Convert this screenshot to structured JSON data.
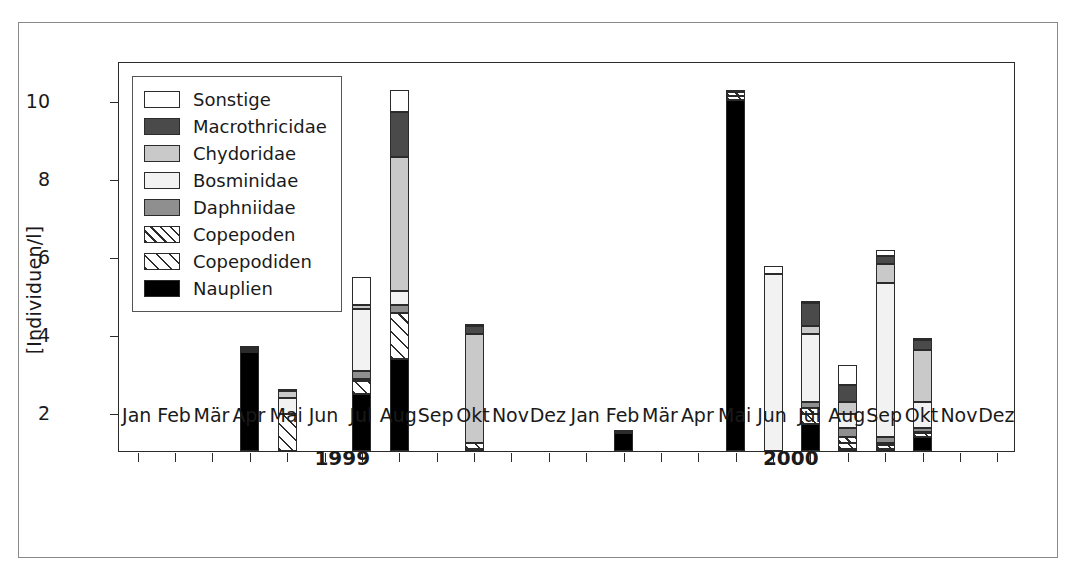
{
  "chart_data": {
    "type": "bar",
    "stacked": true,
    "title": "",
    "xlabel": "",
    "ylabel": "[Individuen/l]",
    "ylim": [
      1,
      11
    ],
    "yticks": [
      2,
      4,
      6,
      8,
      10
    ],
    "grid": false,
    "legend_position": "top-left",
    "period_labels": [
      "1999",
      "2000"
    ],
    "categories": [
      "Jan",
      "Feb",
      "Mär",
      "Apr",
      "Mai",
      "Jun",
      "Jul",
      "Aug",
      "Sep",
      "Okt",
      "Nov",
      "Dez",
      "Jan",
      "Feb",
      "Mär",
      "Apr",
      "Mai",
      "Jun",
      "Jul",
      "Aug",
      "Sep",
      "Okt",
      "Nov",
      "Dez"
    ],
    "series": [
      {
        "name": "Nauplien",
        "key": "nauplien",
        "color": "#000000",
        "pattern": "solid",
        "values": [
          0,
          0,
          0,
          3.55,
          0,
          0,
          2.45,
          3.35,
          0,
          1.05,
          0,
          0,
          0,
          1.45,
          0,
          0,
          10.0,
          0,
          1.7,
          1.05,
          1.05,
          1.35,
          0,
          0
        ]
      },
      {
        "name": "Copepodiden",
        "key": "copepodiden",
        "color": "#ffffff",
        "pattern": "hatch-wide",
        "values": [
          0,
          0,
          0,
          0.05,
          1.95,
          0,
          0.35,
          1.2,
          0,
          0.15,
          0,
          0,
          0,
          0.05,
          0,
          0,
          0.1,
          0,
          0.25,
          0.15,
          0.1,
          0.1,
          0,
          0
        ]
      },
      {
        "name": "Copepoden",
        "key": "copepoden",
        "color": "#ffffff",
        "pattern": "hatch-tight",
        "values": [
          0,
          0,
          0,
          0,
          0,
          0,
          0.05,
          0,
          0,
          0,
          0,
          0,
          0,
          0,
          0,
          0,
          0.1,
          0,
          0.15,
          0.15,
          0.05,
          0.05,
          0,
          0
        ]
      },
      {
        "name": "Daphniidae",
        "key": "daphniidae",
        "color": "#8f8f8f",
        "pattern": "solid",
        "values": [
          0,
          0,
          0,
          0,
          0,
          0,
          0.2,
          0.2,
          0,
          0,
          0,
          0,
          0,
          0,
          0,
          0,
          0,
          0,
          0.15,
          0.25,
          0.15,
          0.1,
          0,
          0
        ]
      },
      {
        "name": "Bosminidae",
        "key": "bosminidae",
        "color": "#f2f2f2",
        "pattern": "solid",
        "values": [
          0,
          0,
          0,
          0.05,
          0.4,
          0,
          1.6,
          0.35,
          0,
          0,
          0,
          0,
          0,
          0,
          0,
          0,
          0,
          5.55,
          1.75,
          0.35,
          3.95,
          0.65,
          0,
          0
        ]
      },
      {
        "name": "Chydoridae",
        "key": "chydoridae",
        "color": "#c9c9c9",
        "pattern": "solid",
        "values": [
          0,
          0,
          0,
          0,
          0.2,
          0,
          0.1,
          3.45,
          0,
          2.8,
          0,
          0,
          0,
          0,
          0,
          0,
          0,
          0,
          0.2,
          0.3,
          0.5,
          1.35,
          0,
          0
        ]
      },
      {
        "name": "Macrothricidae",
        "key": "macrothricidae",
        "color": "#4a4a4a",
        "pattern": "solid",
        "values": [
          0,
          0,
          0,
          0,
          0,
          0,
          0,
          1.15,
          0,
          0.2,
          0,
          0,
          0,
          0,
          0,
          0,
          0,
          0,
          0.6,
          0.45,
          0.2,
          0.25,
          0,
          0
        ]
      },
      {
        "name": "Sonstige",
        "key": "sonstige",
        "color": "#ffffff",
        "pattern": "solid",
        "values": [
          0,
          0,
          0,
          0.05,
          0.05,
          0,
          0.7,
          0.55,
          0,
          0.05,
          0,
          0,
          0,
          0.05,
          0,
          0,
          0.05,
          0.2,
          0.05,
          0.5,
          0.15,
          0.05,
          0,
          0
        ]
      }
    ]
  },
  "legend": {
    "items": [
      {
        "label": "Sonstige",
        "swatch": "sw-sonstige"
      },
      {
        "label": "Macrothricidae",
        "swatch": "sw-macrothricidae"
      },
      {
        "label": "Chydoridae",
        "swatch": "sw-chydoridae"
      },
      {
        "label": "Bosminidae",
        "swatch": "sw-bosminidae"
      },
      {
        "label": "Daphniidae",
        "swatch": "sw-daphniidae"
      },
      {
        "label": "Copepoden",
        "swatch": "sw-copepoden"
      },
      {
        "label": "Copepodiden",
        "swatch": "sw-copepodiden"
      },
      {
        "label": "Nauplien",
        "swatch": "sw-nauplien"
      }
    ]
  }
}
